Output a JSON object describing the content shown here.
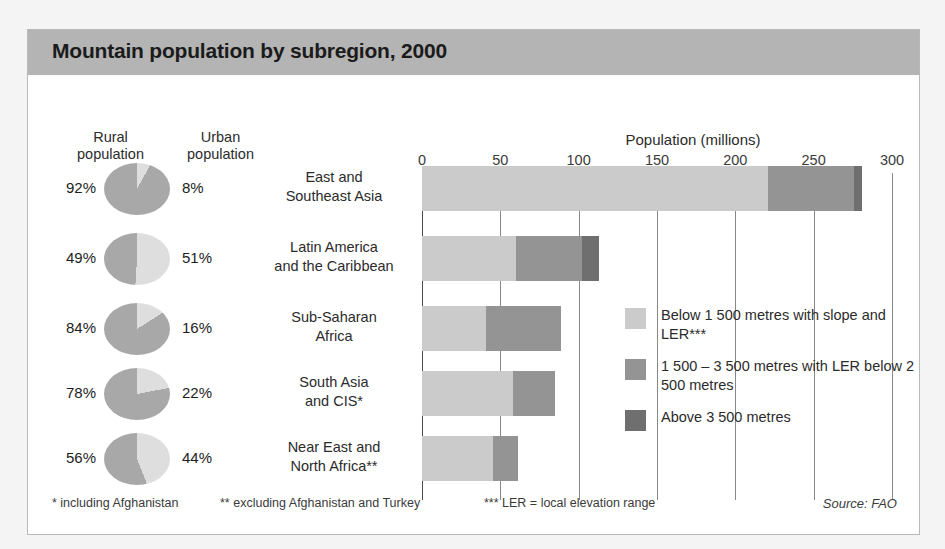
{
  "title": "Mountain population by subregion, 2000",
  "headers": {
    "rural": "Rural\npopulation",
    "rural_line1": "Rural",
    "rural_line2": "population",
    "urban_line1": "Urban",
    "urban_line2": "population"
  },
  "axis": {
    "title": "Population (millions)",
    "ticks": [
      0,
      50,
      100,
      150,
      200,
      250,
      300
    ]
  },
  "legend": {
    "items": [
      {
        "label": "Below 1 500 metres with slope and LER***",
        "color": "#cbcbcb",
        "key": "below_1500"
      },
      {
        "label": "1 500 – 3 500 metres with LER below 2 500 metres",
        "color": "#949494",
        "key": "1500_3500"
      },
      {
        "label": "Above 3 500 metres",
        "color": "#6f6f6f",
        "key": "above_3500"
      }
    ]
  },
  "footnotes": [
    "* including Afghanistan",
    "** excluding Afghanistan and Turkey",
    "*** LER = local elevation range"
  ],
  "source": "Source: FAO",
  "colors": {
    "light": "#cbcbcb",
    "mid": "#949494",
    "dark": "#6f6f6f",
    "title_band": "#b4b4b4",
    "pie_rural": "#a8a8a8",
    "pie_urban": "#dedede"
  },
  "chart_data": {
    "type": "bar",
    "title": "Mountain population by subregion, 2000",
    "xlabel": "Population (millions)",
    "ylabel": "",
    "xlim": [
      0,
      300
    ],
    "orientation": "horizontal",
    "stacked": true,
    "grid": true,
    "legend_position": "right",
    "categories": [
      "East and Southeast Asia",
      "Latin America and the Caribbean",
      "Sub-Saharan Africa",
      "South Asia and CIS*",
      "Near East and North Africa**"
    ],
    "category_lines": [
      [
        "East and",
        "Southeast Asia"
      ],
      [
        "Latin America",
        "and the Caribbean"
      ],
      [
        "Sub-Saharan",
        "Africa"
      ],
      [
        "South Asia",
        "and CIS*"
      ],
      [
        "Near East and",
        "North Africa**"
      ]
    ],
    "series": [
      {
        "name": "Below 1 500 metres with slope and LER***",
        "color": "#cbcbcb",
        "values": [
          221,
          60,
          41,
          58,
          45
        ]
      },
      {
        "name": "1 500 – 3 500 metres with LER below 2 500 metres",
        "color": "#949494",
        "values": [
          55,
          42,
          48,
          27,
          16
        ]
      },
      {
        "name": "Above 3 500 metres",
        "color": "#6f6f6f",
        "values": [
          5,
          11,
          0,
          0,
          0
        ]
      }
    ],
    "totals": [
      281,
      113,
      89,
      85,
      61
    ],
    "pies": [
      {
        "category": "East and Southeast Asia",
        "rural": "92%",
        "urban": "8%",
        "rural_value": 92,
        "urban_value": 8
      },
      {
        "category": "Latin America and the Caribbean",
        "rural": "49%",
        "urban": "51%",
        "rural_value": 49,
        "urban_value": 51
      },
      {
        "category": "Sub-Saharan Africa",
        "rural": "84%",
        "urban": "16%",
        "rural_value": 84,
        "urban_value": 16
      },
      {
        "category": "South Asia and CIS*",
        "rural": "78%",
        "urban": "22%",
        "rural_value": 78,
        "urban_value": 22
      },
      {
        "category": "Near East and North Africa**",
        "rural": "56%",
        "urban": "44%",
        "rural_value": 56,
        "urban_value": 44
      }
    ]
  }
}
